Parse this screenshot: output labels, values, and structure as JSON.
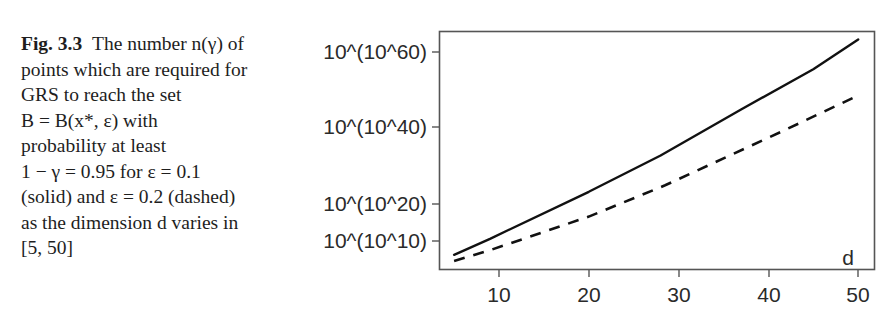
{
  "caption": {
    "fig_label": "Fig. 3.3",
    "lines": [
      "The number n(γ) of",
      "points which are required for",
      "GRS to reach the set",
      "B = B(x*, ε) with",
      "probability at least",
      "1 − γ = 0.95 for ε = 0.1",
      "(solid) and ε = 0.2 (dashed)",
      "as the dimension d varies in",
      "[5, 50]"
    ]
  },
  "chart_data": {
    "type": "line",
    "title": "",
    "xlabel": "d",
    "ylabel": "",
    "xlim": [
      4,
      52
    ],
    "x_ticks": [
      10,
      20,
      30,
      40,
      50
    ],
    "y_scale": "double-log (exponent of exponent, linear in k for 10^(10^k))",
    "y_ticks": [
      {
        "k": 10,
        "label": "10^(10^10)"
      },
      {
        "k": 20,
        "label": "10^(10^20)"
      },
      {
        "k": 40,
        "label": "10^(10^40)"
      },
      {
        "k": 60,
        "label": "10^(10^60)"
      }
    ],
    "grid": false,
    "legend": "none (described in caption: solid ε=0.1, dashed ε=0.2)",
    "series": [
      {
        "name": "ε = 0.1 (solid)",
        "style": "solid",
        "x": [
          5,
          9,
          20,
          28,
          37,
          45,
          50
        ],
        "k": [
          6.7,
          10.9,
          23.2,
          32.7,
          44.8,
          55.3,
          63.1
        ]
      },
      {
        "name": "ε = 0.2 (dashed)",
        "style": "dashed",
        "x": [
          5,
          9,
          20,
          28.5,
          41.5,
          50
        ],
        "k": [
          5.1,
          7.9,
          16.7,
          24.9,
          39.0,
          48.4
        ]
      }
    ]
  },
  "axis": {
    "x_tick_labels": [
      "10",
      "20",
      "30",
      "40",
      "50"
    ],
    "y_tick_labels": [
      "10^(10^60)",
      "10^(10^40)",
      "10^(10^20)",
      "10^(10^10)"
    ],
    "x_axis_label": "d"
  }
}
